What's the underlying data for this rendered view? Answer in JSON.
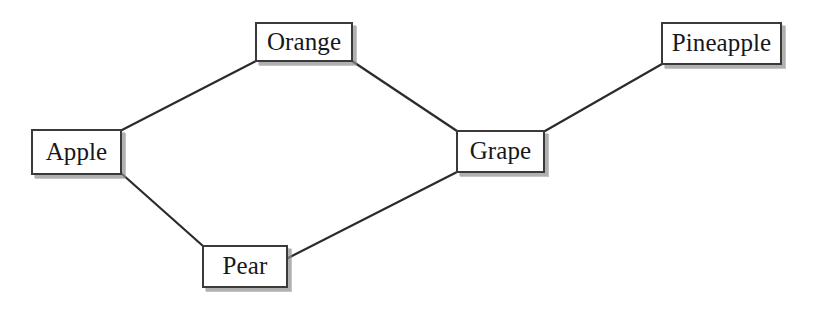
{
  "diagram": {
    "type": "undirected-node-link-graph",
    "background_color": "#ffffff",
    "node_fill_color": "#ffffff",
    "node_border_color": "#3a3a3a",
    "edge_color": "#2b2b2b",
    "shadow_color": "#969696",
    "text_color": "#17171c",
    "nodes": [
      {
        "id": "apple",
        "label": "Apple",
        "x": 31,
        "y": 129,
        "w": 91,
        "h": 46
      },
      {
        "id": "orange",
        "label": "Orange",
        "x": 255,
        "y": 22,
        "w": 98,
        "h": 40
      },
      {
        "id": "pear",
        "label": "Pear",
        "x": 202,
        "y": 245,
        "w": 86,
        "h": 43
      },
      {
        "id": "grape",
        "label": "Grape",
        "x": 456,
        "y": 130,
        "w": 89,
        "h": 43
      },
      {
        "id": "pineapple",
        "label": "Pineapple",
        "x": 661,
        "y": 22,
        "w": 121,
        "h": 43
      }
    ],
    "edges": [
      {
        "id": "apple-orange",
        "from": "apple",
        "to": "orange",
        "x1": 122,
        "y1": 130,
        "x2": 256,
        "y2": 61
      },
      {
        "id": "apple-pear",
        "from": "apple",
        "to": "pear",
        "x1": 122,
        "y1": 174,
        "x2": 203,
        "y2": 246
      },
      {
        "id": "orange-grape",
        "from": "orange",
        "to": "grape",
        "x1": 352,
        "y1": 61,
        "x2": 457,
        "y2": 131
      },
      {
        "id": "pear-grape",
        "from": "pear",
        "to": "grape",
        "x1": 288,
        "y1": 258,
        "x2": 457,
        "y2": 172
      },
      {
        "id": "grape-pineapple",
        "from": "grape",
        "to": "pineapple",
        "x1": 545,
        "y1": 131,
        "x2": 662,
        "y2": 64
      }
    ]
  }
}
